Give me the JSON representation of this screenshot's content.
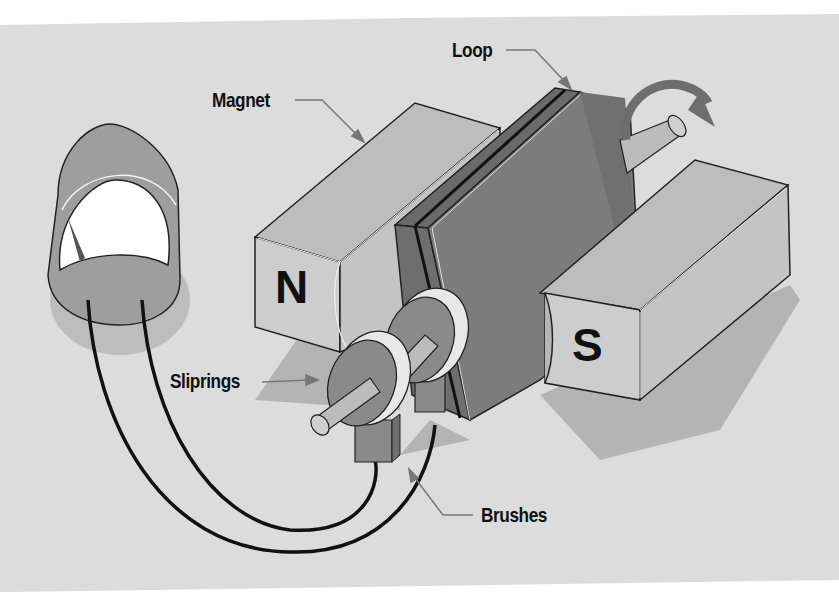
{
  "diagram": {
    "labels": {
      "magnet": "Magnet",
      "loop": "Loop",
      "sliprings": "Sliprings",
      "brushes": "Brushes"
    },
    "poles": {
      "north": "N",
      "south": "S"
    },
    "colors": {
      "background": "#dcdcdc",
      "page": "#ffffff",
      "magnet_face": "#c9c9c9",
      "magnet_top": "#bdbdbd",
      "magnet_side": "#a9a9a9",
      "loop_face": "#7a7a7a",
      "loop_side": "#6a6a6a",
      "slipring": "#8a8a8a",
      "slipring_rim": "#e8e8e8",
      "shaft": "#bcbcbc",
      "meter_body": "#9e9e9e",
      "meter_face": "#ffffff",
      "wire": "#111111",
      "arrow_leader": "#777777",
      "rotation_arrow": "#6e6e6e",
      "shadow": "#b3b3b3"
    }
  }
}
